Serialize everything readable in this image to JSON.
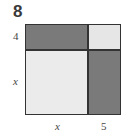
{
  "problem_number": "8",
  "labels": {
    "left_top": "4",
    "left_bottom": "x",
    "bottom_left": "x",
    "bottom_right": "5"
  },
  "regions": [
    {
      "name": "top-left",
      "shade": "dark",
      "color": "#7a7a7a",
      "dims": "x by 4"
    },
    {
      "name": "top-right",
      "shade": "light",
      "color": "#e6e6e6",
      "dims": "5 by 4"
    },
    {
      "name": "bottom-left",
      "shade": "light",
      "color": "#ebebeb",
      "dims": "x by x"
    },
    {
      "name": "bottom-right",
      "shade": "dark",
      "color": "#7a7a7a",
      "dims": "5 by x"
    }
  ]
}
